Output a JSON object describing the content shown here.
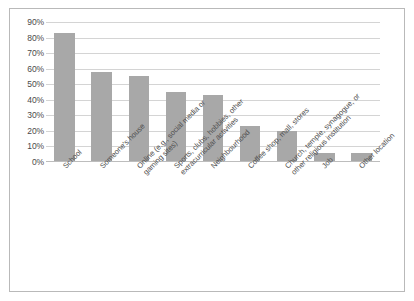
{
  "chart_data": {
    "type": "bar",
    "title": "",
    "subtitle": "",
    "xlabel": "",
    "ylabel": "",
    "ylim": [
      0,
      90
    ],
    "grid": true,
    "legend": "none",
    "bar_color": "#a8a8a8",
    "gridline_color": "#d4d4d4",
    "border_color": "#b9b9b9",
    "categories": [
      "School",
      "Someone's house",
      "Online (e.g., social media or gaming sites)",
      "Sports, clubs, hobbies, other extracurricular activities",
      "Neighbourhood",
      "Coffee shop, mall, stores",
      "Church, temple, synagogue, or other religious institution",
      "Job",
      "Other location"
    ],
    "category_lines": [
      [
        "School"
      ],
      [
        "Someone's house"
      ],
      [
        "Online (e.g., social media or",
        "gaming sites)"
      ],
      [
        "Sports, clubs, hobbies, other",
        "extracurricular activities"
      ],
      [
        "Neighbourhood"
      ],
      [
        "Coffee shop, mall, stores"
      ],
      [
        "Church, temple, synagogue, or",
        "other religious institution"
      ],
      [
        "Job"
      ],
      [
        "Other location"
      ]
    ],
    "values": [
      83,
      58,
      55,
      45,
      43,
      23,
      20,
      6,
      6
    ],
    "y_ticks": [
      0,
      10,
      20,
      30,
      40,
      50,
      60,
      70,
      80,
      90
    ],
    "y_tick_labels": [
      "0%",
      "10%",
      "20%",
      "30%",
      "40%",
      "50%",
      "60%",
      "70%",
      "80%",
      "90%"
    ]
  }
}
